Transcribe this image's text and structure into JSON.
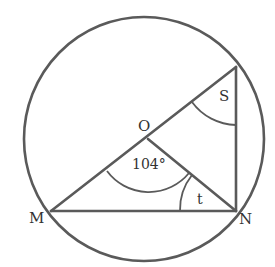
{
  "diagram": {
    "type": "circle-geometry",
    "stroke_color": "#555555",
    "circle": {
      "center_label": "O"
    },
    "points": {
      "M": "M",
      "N": "N",
      "O": "O"
    },
    "angles": {
      "central_angle_MON": "104°",
      "angle_S": "S",
      "angle_t": "t"
    }
  }
}
